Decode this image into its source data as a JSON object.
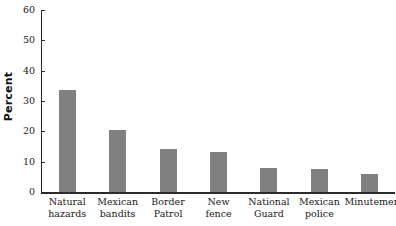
{
  "chart_data": {
    "type": "bar",
    "title": "",
    "xlabel": "",
    "ylabel": "Percent",
    "ylim": [
      0,
      60
    ],
    "yticks": [
      0,
      10,
      20,
      30,
      40,
      50,
      60
    ],
    "grid": false,
    "legend": false,
    "bar_color": "#808080",
    "axis_color": "#2b2b2b",
    "categories": [
      "Natural hazards",
      "Mexican bandits",
      "Border Patrol",
      "New fence",
      "National Guard",
      "Mexican police",
      "Minutemen"
    ],
    "category_lines": [
      [
        "Natural",
        "hazards"
      ],
      [
        "Mexican",
        "bandits"
      ],
      [
        "Border",
        "Patrol"
      ],
      [
        "New",
        "fence"
      ],
      [
        "National",
        "Guard"
      ],
      [
        "Mexican",
        "police"
      ],
      [
        "Minutemen"
      ]
    ],
    "values": [
      33.5,
      20.5,
      14.2,
      13.2,
      7.9,
      7.6,
      6.0
    ]
  }
}
